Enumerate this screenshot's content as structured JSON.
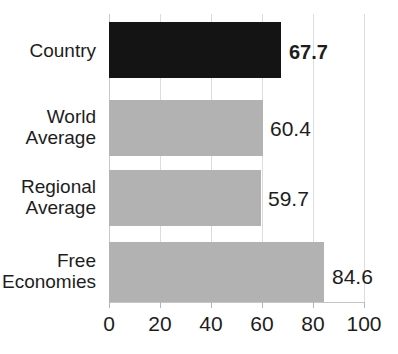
{
  "chart_data": {
    "type": "bar",
    "orientation": "horizontal",
    "title": "",
    "xlabel": "",
    "ylabel": "",
    "xlim": [
      0,
      100
    ],
    "xticks": [
      0,
      20,
      40,
      60,
      80,
      100
    ],
    "grid": true,
    "legend": "none",
    "categories": [
      "Country",
      "World Average",
      "Regional Average",
      "Free Economies"
    ],
    "values": [
      67.7,
      60.4,
      59.7,
      84.6
    ],
    "value_labels": [
      "67.7",
      "60.4",
      "59.7",
      "84.6"
    ],
    "bars": [
      {
        "category": "Country",
        "label_line1": "Country",
        "label_line2": "",
        "value": 67.7,
        "value_label": "67.7",
        "color": "#141414",
        "emphasis": true
      },
      {
        "category": "World Average",
        "label_line1": "World",
        "label_line2": "Average",
        "value": 60.4,
        "value_label": "60.4",
        "color": "#b2b2b2",
        "emphasis": false
      },
      {
        "category": "Regional Average",
        "label_line1": "Regional",
        "label_line2": "Average",
        "value": 59.7,
        "value_label": "59.7",
        "color": "#b2b2b2",
        "emphasis": false
      },
      {
        "category": "Free Economies",
        "label_line1": "Free",
        "label_line2": "Economies",
        "value": 84.6,
        "value_label": "84.6",
        "color": "#b2b2b2",
        "emphasis": false
      }
    ]
  },
  "axis": {
    "tick_labels": [
      "0",
      "20",
      "40",
      "60",
      "80",
      "100"
    ]
  },
  "labels": {
    "country": "Country",
    "world_average_line1": "World",
    "world_average_line2": "Average",
    "regional_average_line1": "Regional",
    "regional_average_line2": "Average",
    "free_economies_line1": "Free",
    "free_economies_line2": "Economies"
  },
  "values": {
    "country": "67.7",
    "world_average": "60.4",
    "regional_average": "59.7",
    "free_economies": "84.6"
  },
  "title": {
    "remnant": ""
  },
  "colors": {
    "highlight_bar": "#141414",
    "default_bar": "#b2b2b2",
    "gridline": "#dcdcdc",
    "text": "#1d1d1d",
    "background": "#ffffff"
  }
}
